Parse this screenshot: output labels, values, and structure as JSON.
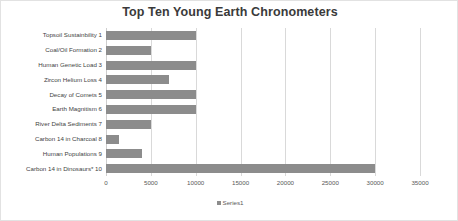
{
  "chart_data": {
    "type": "bar",
    "orientation": "horizontal",
    "title": "Top Ten Young Earth Chronometers",
    "xlabel": "",
    "ylabel": "",
    "grid": true,
    "legend_position": "bottom",
    "xlim": [
      0,
      35000
    ],
    "xticks": [
      0,
      5000,
      10000,
      15000,
      20000,
      25000,
      30000,
      35000
    ],
    "xtick_labels": [
      "0",
      "5000",
      "10000",
      "15000",
      "20000",
      "25000",
      "30000",
      "35000"
    ],
    "categories": [
      "Topsoil Sustainbility 1",
      "Coal/Oil Formation 2",
      "Human Genetic Load 3",
      "Zircon Helium Loss 4",
      "Decay of Comets 5",
      "Earth Magnitism 6",
      "River Delta Sediments 7",
      "Carbon 14 in Charcoal 8",
      "Human Populations 9",
      "Carbon 14 in Dinosaurs* 10"
    ],
    "series": [
      {
        "name": "Series1",
        "color": "#8c8c8c",
        "values": [
          10000,
          5000,
          10000,
          7000,
          10000,
          10000,
          5000,
          1500,
          4000,
          30000
        ]
      }
    ]
  },
  "legend": {
    "marker": "square-marker",
    "label": "Series1"
  },
  "colors": {
    "bar": "#8c8c8c",
    "gridline": "#d9d9d9",
    "title": "#3a3a3a",
    "label": "#3f3f3f",
    "tick": "#595959",
    "frame": "#e2e2e2",
    "background": "#ffffff"
  }
}
